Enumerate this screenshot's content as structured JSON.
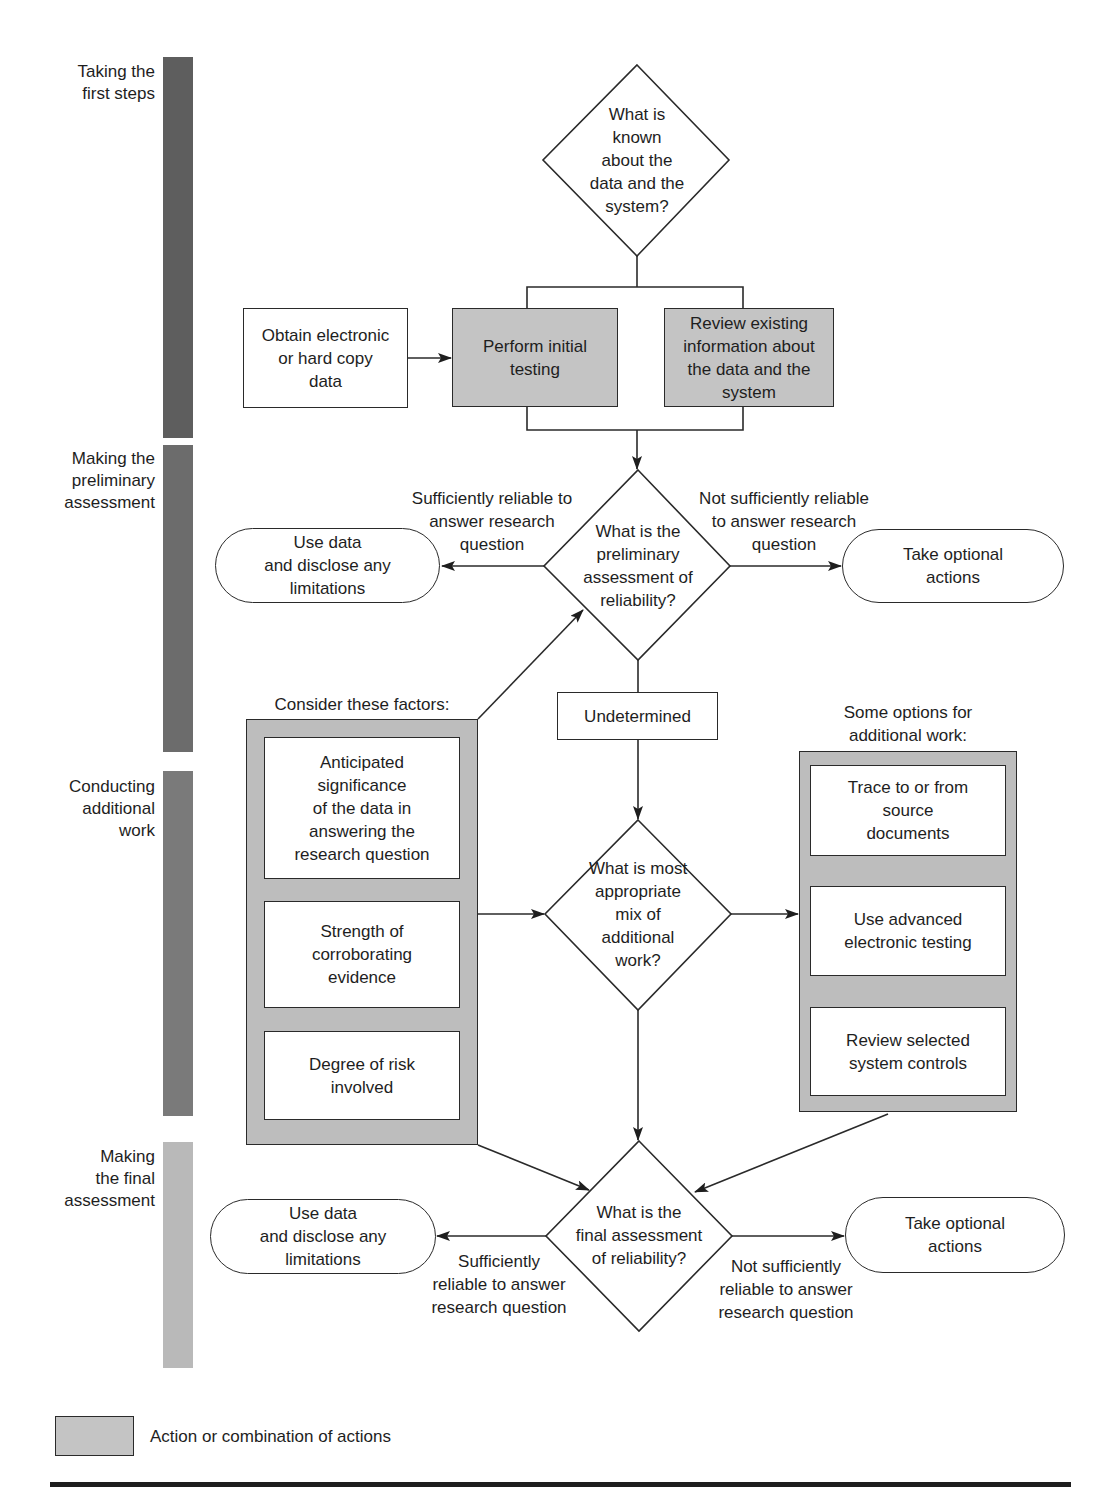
{
  "phases": [
    {
      "label": "Taking the\nfirst steps",
      "color": "#5e5e5e"
    },
    {
      "label": "Making the\npreliminary\nassessment",
      "color": "#6c6c6c"
    },
    {
      "label": "Conducting\nadditional\nwork",
      "color": "#7a7a7a"
    },
    {
      "label": "Making\nthe final\nassessment",
      "color": "#b9b9b9"
    }
  ],
  "decisions": {
    "known": "What is\nknown\nabout the\ndata and the\nsystem?",
    "preliminary": "What is the\npreliminary\nassessment of\nreliability?",
    "mix": "What is most\nappropriate\nmix of\nadditional\nwork?",
    "final": "What is the\nfinal assessment\nof reliability?"
  },
  "first_steps": {
    "obtain": "Obtain electronic\nor hard copy\ndata",
    "perform": "Perform initial\ntesting",
    "review": "Review existing\ninformation about\nthe data and the\nsystem"
  },
  "preliminary": {
    "sufficient_label": "Sufficiently reliable to\nanswer research\nquestion",
    "not_sufficient_label": "Not sufficiently reliable\nto answer research\nquestion",
    "use_data": "Use data\nand disclose any\nlimitations",
    "optional_actions": "Take optional\nactions",
    "undetermined": "Undetermined"
  },
  "factors": {
    "title": "Consider these factors:",
    "items": [
      "Anticipated\nsignificance\nof the data in\nanswering the\nresearch question",
      "Strength of\ncorroborating\nevidence",
      "Degree of risk\ninvolved"
    ]
  },
  "options": {
    "title": "Some options for\nadditional work:",
    "items": [
      "Trace to or from\nsource\ndocuments",
      "Use advanced\nelectronic testing",
      "Review selected\nsystem controls"
    ]
  },
  "final": {
    "sufficient_label": "Sufficiently\nreliable to answer\nresearch question",
    "not_sufficient_label": "Not sufficiently\nreliable to answer\nresearch question",
    "use_data": "Use data\nand disclose any\nlimitations",
    "optional_actions": "Take optional\nactions"
  },
  "legend": {
    "label": "Action or combination of actions",
    "swatch_color": "#c4c4c4"
  }
}
